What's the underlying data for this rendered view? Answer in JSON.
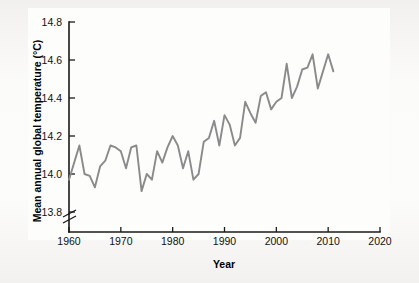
{
  "figure": {
    "background_color": "#f3f2f0",
    "plate_color": "#fdfdfc"
  },
  "chart_data": {
    "type": "line",
    "title": "",
    "xlabel": "Year",
    "ylabel": "Mean annual global temperature (°C)",
    "xlim": [
      1960,
      2020
    ],
    "ylim": [
      13.8,
      14.8
    ],
    "y_axis_broken_below": 13.8,
    "grid": false,
    "legend": null,
    "line_color": "#8a8a8a",
    "xticks": [
      1960,
      1970,
      1980,
      1990,
      2000,
      2010,
      2020
    ],
    "xtick_labels": [
      "1960",
      "1970",
      "1980",
      "1990",
      "2000",
      "2010",
      "2020"
    ],
    "yticks": [
      13.8,
      14.0,
      14.2,
      14.4,
      14.6,
      14.8
    ],
    "ytick_labels": [
      "13.8",
      "14.0",
      "14.2",
      "14.4",
      "14.6",
      "14.8"
    ],
    "series": [
      {
        "name": "Mean annual global temperature",
        "x": [
          1960,
          1961,
          1962,
          1963,
          1964,
          1965,
          1966,
          1967,
          1968,
          1969,
          1970,
          1971,
          1972,
          1973,
          1974,
          1975,
          1976,
          1977,
          1978,
          1979,
          1980,
          1981,
          1982,
          1983,
          1984,
          1985,
          1986,
          1987,
          1988,
          1989,
          1990,
          1991,
          1992,
          1993,
          1994,
          1995,
          1996,
          1997,
          1998,
          1999,
          2000,
          2001,
          2002,
          2003,
          2004,
          2005,
          2006,
          2007,
          2008,
          2009,
          2010,
          2011
        ],
        "values": [
          13.97,
          14.06,
          14.15,
          14.0,
          13.99,
          13.93,
          14.04,
          14.07,
          14.15,
          14.14,
          14.12,
          14.03,
          14.14,
          14.15,
          13.91,
          14.0,
          13.97,
          14.12,
          14.06,
          14.14,
          14.2,
          14.15,
          14.03,
          14.12,
          13.97,
          14.0,
          14.17,
          14.19,
          14.28,
          14.15,
          14.31,
          14.26,
          14.15,
          14.19,
          14.38,
          14.32,
          14.27,
          14.41,
          14.43,
          14.34,
          14.38,
          14.4,
          14.58,
          14.4,
          14.46,
          14.55,
          14.56,
          14.63,
          14.45,
          14.54,
          14.63,
          14.54
        ]
      }
    ]
  }
}
